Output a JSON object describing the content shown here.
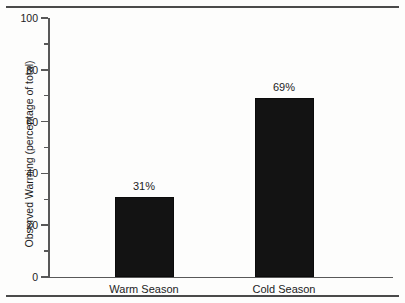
{
  "chart_data": {
    "type": "bar",
    "title": "",
    "xlabel": "",
    "ylabel": "Observed Warming (percentage of total)",
    "categories": [
      "Warm Season",
      "Cold Season"
    ],
    "values": [
      31,
      69
    ],
    "value_labels": [
      "31%",
      "69%"
    ],
    "ylim": [
      0,
      100
    ],
    "ytick_labels": [
      "0",
      "20",
      "40",
      "60",
      "80",
      "100"
    ],
    "ytick_values": [
      0,
      20,
      40,
      60,
      80,
      100
    ],
    "yminor_values": [
      10,
      30,
      50,
      70,
      90
    ],
    "grid": false,
    "legend": null,
    "bar_color": "#131313",
    "axis_color": "#585858",
    "text_color": "#1c1c1c",
    "background": "#fdfdfc"
  }
}
